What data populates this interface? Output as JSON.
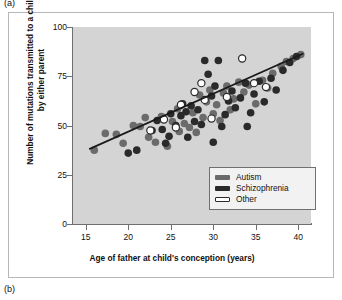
{
  "panels": {
    "a_label": "(a)",
    "b_label": "(b)"
  },
  "chart_data": {
    "type": "scatter",
    "title": "",
    "xlabel": "Age of father at child's conception (years)",
    "ylabel": "Number of mutations transmitted to a child by either parent",
    "xlim": [
      13.5,
      41.5
    ],
    "ylim": [
      0,
      100
    ],
    "xticks": [
      15,
      20,
      25,
      30,
      35,
      40
    ],
    "yticks": [
      0,
      25,
      50,
      75,
      100
    ],
    "grid": false,
    "legend_position": "lower right",
    "legend": [
      {
        "label": "Autism",
        "color": "#6b6b6b",
        "marker": "filled-circle"
      },
      {
        "label": "Schizophrenia",
        "color": "#2a2a2a",
        "marker": "filled-circle"
      },
      {
        "label": "Other",
        "color": "#ffffff",
        "marker": "open-circle"
      }
    ],
    "trendline": {
      "label": "regression line",
      "color": "#1a1a1a",
      "x": [
        15.4,
        40.6
      ],
      "y": [
        38.0,
        86.5
      ]
    },
    "series": [
      {
        "name": "Autism",
        "color": "#6b6b6b",
        "points": [
          [
            16.0,
            37.5
          ],
          [
            17.3,
            46.0
          ],
          [
            18.6,
            45.5
          ],
          [
            19.4,
            41.0
          ],
          [
            20.6,
            50.0
          ],
          [
            21.4,
            49.5
          ],
          [
            22.4,
            44.0
          ],
          [
            23.2,
            41.5
          ],
          [
            22.0,
            54.0
          ],
          [
            23.9,
            54.5
          ],
          [
            24.6,
            39.5
          ],
          [
            25.2,
            52.0
          ],
          [
            25.8,
            58.5
          ],
          [
            26.0,
            47.0
          ],
          [
            26.6,
            51.0
          ],
          [
            27.2,
            49.0
          ],
          [
            27.6,
            56.5
          ],
          [
            28.0,
            46.5
          ],
          [
            28.4,
            65.5
          ],
          [
            28.8,
            54.0
          ],
          [
            29.2,
            62.0
          ],
          [
            29.6,
            68.0
          ],
          [
            30.0,
            56.0
          ],
          [
            30.4,
            60.5
          ],
          [
            30.8,
            52.5
          ],
          [
            31.2,
            66.5
          ],
          [
            31.6,
            70.0
          ],
          [
            32.0,
            58.0
          ],
          [
            32.4,
            63.5
          ],
          [
            33.0,
            72.0
          ],
          [
            33.6,
            67.0
          ],
          [
            34.2,
            70.5
          ],
          [
            35.0,
            61.0
          ],
          [
            35.8,
            73.0
          ],
          [
            36.4,
            69.0
          ],
          [
            37.0,
            76.5
          ],
          [
            38.0,
            80.0
          ],
          [
            38.6,
            82.5
          ],
          [
            39.4,
            84.0
          ],
          [
            40.3,
            86.0
          ]
        ]
      },
      {
        "name": "Schizophrenia",
        "color": "#2a2a2a",
        "points": [
          [
            20.0,
            36.0
          ],
          [
            21.0,
            37.5
          ],
          [
            22.8,
            47.5
          ],
          [
            24.0,
            48.0
          ],
          [
            24.8,
            44.5
          ],
          [
            25.0,
            56.0
          ],
          [
            25.6,
            50.0
          ],
          [
            26.2,
            55.0
          ],
          [
            26.8,
            57.0
          ],
          [
            27.0,
            44.0
          ],
          [
            27.4,
            60.0
          ],
          [
            27.8,
            52.0
          ],
          [
            28.2,
            58.0
          ],
          [
            28.6,
            50.5
          ],
          [
            29.0,
            83.0
          ],
          [
            29.4,
            76.0
          ],
          [
            29.8,
            65.0
          ],
          [
            30.2,
            70.0
          ],
          [
            30.6,
            83.0
          ],
          [
            31.0,
            49.5
          ],
          [
            31.4,
            55.5
          ],
          [
            31.8,
            62.5
          ],
          [
            32.2,
            67.5
          ],
          [
            32.6,
            59.0
          ],
          [
            33.2,
            64.0
          ],
          [
            33.8,
            71.5
          ],
          [
            34.4,
            56.5
          ],
          [
            34.8,
            66.0
          ],
          [
            35.4,
            72.5
          ],
          [
            36.0,
            62.0
          ],
          [
            36.8,
            74.0
          ],
          [
            37.4,
            68.0
          ],
          [
            38.2,
            78.0
          ],
          [
            39.0,
            82.0
          ],
          [
            39.8,
            85.0
          ],
          [
            24.4,
            41.0
          ],
          [
            30.0,
            41.5
          ],
          [
            26.4,
            61.0
          ],
          [
            23.4,
            52.5
          ],
          [
            34.0,
            49.5
          ]
        ]
      },
      {
        "name": "Other",
        "color": "#ffffff",
        "points": [
          [
            22.6,
            47.5
          ],
          [
            24.2,
            53.0
          ],
          [
            26.2,
            60.5
          ],
          [
            27.8,
            67.0
          ],
          [
            28.6,
            71.5
          ],
          [
            29.0,
            63.0
          ],
          [
            29.8,
            53.5
          ],
          [
            31.6,
            64.5
          ],
          [
            33.4,
            84.0
          ],
          [
            34.8,
            71.5
          ],
          [
            36.2,
            69.5
          ],
          [
            25.6,
            49.0
          ]
        ]
      }
    ]
  }
}
